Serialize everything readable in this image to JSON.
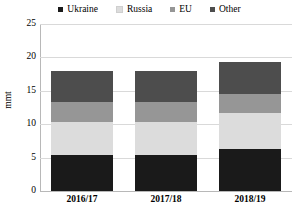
{
  "chart_data": {
    "type": "bar",
    "title": "",
    "subtitle": "",
    "xlabel": "",
    "ylabel": "mmt",
    "stacked": true,
    "grid": true,
    "legend_position": "top",
    "ylim": [
      0,
      25
    ],
    "yticks": [
      "0",
      "5",
      "10",
      "15",
      "20",
      "25"
    ],
    "ytick_values": [
      0,
      5,
      10,
      15,
      20,
      25
    ],
    "categories": [
      "2016/17",
      "2017/18",
      "2018/19"
    ],
    "series": [
      {
        "name": "Ukraine",
        "color": "#1a1a1a",
        "values": [
          5.4,
          5.4,
          6.3
        ]
      },
      {
        "name": "Russia",
        "color": "#dcdcdc",
        "values": [
          4.9,
          4.9,
          5.4
        ]
      },
      {
        "name": "EU",
        "color": "#969696",
        "values": [
          3.1,
          3.1,
          2.8
        ]
      },
      {
        "name": "Other",
        "color": "#4d4d4d",
        "values": [
          4.6,
          4.6,
          4.8
        ]
      }
    ],
    "totals": [
      18.0,
      18.0,
      19.3
    ]
  },
  "legend": {
    "items": [
      {
        "label": "Ukraine",
        "color": "#1a1a1a"
      },
      {
        "label": "Russia",
        "color": "#dcdcdc"
      },
      {
        "label": "EU",
        "color": "#969696"
      },
      {
        "label": "Other",
        "color": "#4d4d4d"
      }
    ]
  },
  "colors": {
    "axis": "#b8b8b8",
    "grid": "#d9d9d9",
    "background": "#ffffff",
    "text": "#000000"
  }
}
